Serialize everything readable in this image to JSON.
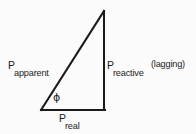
{
  "figure": {
    "kind": "power-triangle-diagram",
    "background_color": "#fbfbfb",
    "line_color": "#1a1a1a",
    "line_width_px": 2
  },
  "triangle": {
    "apex": {
      "x": 104,
      "y": 11
    },
    "bottom_left": {
      "x": 41,
      "y": 110
    },
    "bottom_right": {
      "x": 104,
      "y": 110
    },
    "sides": {
      "hypotenuse": "apparent power",
      "vertical": "reactive power",
      "horizontal": "real power"
    }
  },
  "labels": {
    "apparent": {
      "base": "P",
      "subscript": "apparent"
    },
    "reactive": {
      "base": "P",
      "subscript": "reactive",
      "note": "(lagging)"
    },
    "real": {
      "base": "P",
      "subscript": "real"
    },
    "angle": {
      "symbol": "ϕ"
    }
  }
}
